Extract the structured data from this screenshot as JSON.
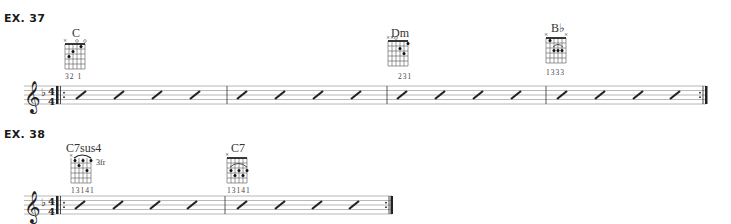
{
  "examples": [
    {
      "label": "EX. 37",
      "key_signature": "F major (1 flat)",
      "time_signature": {
        "top": "4",
        "bottom": "4"
      },
      "measures": 4,
      "beats_per_measure": 4,
      "notation": "rhythm slashes",
      "repeat_start": true,
      "repeat_end": true,
      "chords": [
        {
          "name": "C",
          "fingering": "32 1",
          "muted": "x",
          "open": "o o",
          "measure": 1
        },
        {
          "name": "Dm",
          "fingering": "231",
          "muted": "xxo",
          "measure": 3
        },
        {
          "name": "B♭",
          "fingering": "1333",
          "muted": "x x",
          "measure": 4
        }
      ]
    },
    {
      "label": "EX. 38",
      "key_signature": "F major (1 flat)",
      "time_signature": {
        "top": "4",
        "bottom": "4"
      },
      "measures": 2,
      "beats_per_measure": 4,
      "notation": "rhythm slashes",
      "repeat_start": true,
      "repeat_end": true,
      "chords": [
        {
          "name": "C7sus4",
          "fingering": "13141",
          "fret": "3fr",
          "muted": "x",
          "measure": 1
        },
        {
          "name": "C7",
          "fingering": "13141",
          "muted": "x",
          "measure": 2
        }
      ]
    }
  ]
}
